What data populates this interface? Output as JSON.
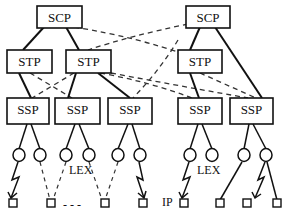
{
  "diagram": {
    "type": "network-topology",
    "colors": {
      "stroke": "#111111",
      "background": "#ffffff"
    },
    "scp_nodes": [
      {
        "id": "scp1",
        "label": "SCP"
      },
      {
        "id": "scp2",
        "label": "SCP"
      }
    ],
    "stp_nodes": [
      {
        "id": "stp1",
        "label": "STP"
      },
      {
        "id": "stp2",
        "label": "STP"
      },
      {
        "id": "stp3",
        "label": "STP"
      }
    ],
    "ssp_nodes": [
      {
        "id": "ssp1",
        "label": "SSP"
      },
      {
        "id": "ssp2",
        "label": "SSP"
      },
      {
        "id": "ssp3",
        "label": "SSP"
      },
      {
        "id": "ssp4",
        "label": "SSP"
      },
      {
        "id": "ssp5",
        "label": "SSP"
      }
    ],
    "annotations": {
      "lex_left": "LEX",
      "lex_right": "LEX",
      "ip": "IP",
      "ellipsis": "- - -"
    },
    "links": {
      "solid": [
        [
          "scp1",
          "stp1"
        ],
        [
          "scp1",
          "stp2"
        ],
        [
          "scp2",
          "stp3"
        ],
        [
          "scp2",
          "ssp5"
        ],
        [
          "stp1",
          "ssp1"
        ],
        [
          "stp2",
          "ssp2"
        ],
        [
          "stp2",
          "ssp3"
        ],
        [
          "stp3",
          "ssp4"
        ]
      ],
      "dashed": [
        [
          "scp1",
          "stp3"
        ],
        [
          "scp2",
          "stp2"
        ],
        [
          "stp1",
          "ssp2"
        ],
        [
          "stp2",
          "ssp1"
        ],
        [
          "stp2",
          "ssp4"
        ],
        [
          "stp3",
          "ssp3"
        ],
        [
          "stp2",
          "ssp5"
        ],
        [
          "stp3",
          "ssp5"
        ]
      ]
    }
  }
}
